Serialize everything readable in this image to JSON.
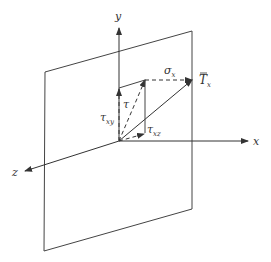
{
  "diagram": {
    "axes": {
      "x": "x",
      "y": "y",
      "z": "z"
    },
    "labels": {
      "traction": {
        "base": "T",
        "sub": "x",
        "overbar": true
      },
      "normal_stress": {
        "base": "σ",
        "sub": "x"
      },
      "shear_stress": {
        "base": "τ",
        "sub": ""
      },
      "shear_xy": {
        "base": "τ",
        "sub": "xy"
      },
      "shear_xz": {
        "base": "τ",
        "sub": "xz"
      }
    },
    "colors": {
      "line": "#444444",
      "background": "#ffffff"
    }
  }
}
